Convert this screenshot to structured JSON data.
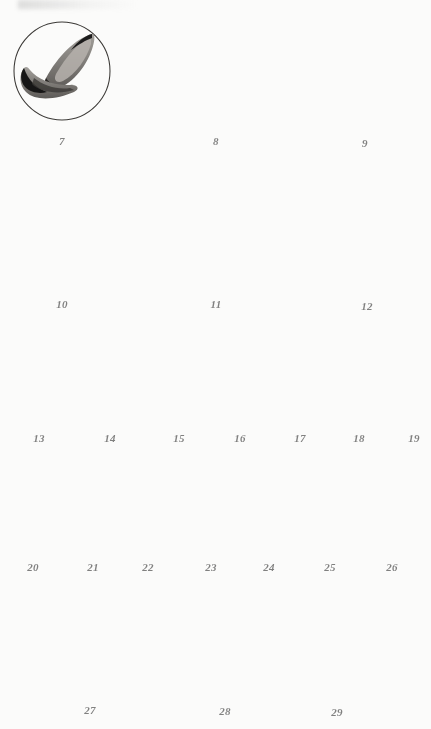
{
  "plate": {
    "title": "Microscopy plate of stained protozoan / flagellate specimens",
    "background_color": "#fbfbfa",
    "ink_color": "#1c1c1c",
    "figure_count": 23,
    "number_style": "italic serif",
    "rows": [
      {
        "row_id": "row-1",
        "kind": "circular-field",
        "labels": [
          "7",
          "8",
          "9"
        ]
      },
      {
        "row_id": "row-2",
        "kind": "circular-field",
        "labels": [
          "10",
          "11",
          "12"
        ]
      },
      {
        "row_id": "row-3",
        "kind": "isolated-specimen",
        "labels": [
          "13",
          "14",
          "15",
          "16",
          "17",
          "18",
          "19"
        ]
      },
      {
        "row_id": "row-4",
        "kind": "isolated-specimen",
        "labels": [
          "20",
          "21",
          "22",
          "23",
          "24",
          "25",
          "26"
        ]
      },
      {
        "row_id": "row-5",
        "kind": "photomicrograph",
        "labels": [
          "27",
          "28",
          "29"
        ]
      }
    ],
    "figures": [
      {
        "label": "7",
        "row": 1,
        "cx": 62,
        "cy": 71,
        "rx": 48,
        "ry": 49,
        "num_x": 62,
        "num_y": 135,
        "desc": "two elongate pointed bodies in circular field"
      },
      {
        "label": "8",
        "row": 1,
        "cx": 216,
        "cy": 71,
        "rx": 47,
        "ry": 50,
        "num_x": 216,
        "num_y": 135,
        "desc": "three-lobed rosette with dark centre"
      },
      {
        "label": "9",
        "row": 1,
        "cx": 365,
        "cy": 71,
        "rx": 45,
        "ry": 48,
        "num_x": 365,
        "num_y": 137,
        "desc": "two dark crescent bodies stacked"
      },
      {
        "label": "10",
        "row": 2,
        "cx": 62,
        "cy": 238,
        "rx": 45,
        "ry": 46,
        "num_x": 62,
        "num_y": 298,
        "desc": "near-empty field with single small dark blob"
      },
      {
        "label": "11",
        "row": 2,
        "cx": 216,
        "cy": 236,
        "rx": 45,
        "ry": 46,
        "num_x": 216,
        "num_y": 298,
        "desc": "single small heart-shaped dark body at centre"
      },
      {
        "label": "12",
        "row": 2,
        "cx": 367,
        "cy": 232,
        "rx": 51,
        "ry": 52,
        "num_x": 367,
        "num_y": 300,
        "desc": "two pear-shaped bodies with ringed nuclei"
      },
      {
        "label": "13",
        "row": 3,
        "cx": 39,
        "cy": 392,
        "num_x": 39,
        "num_y": 432,
        "desc": "round grey cyst with dark hook inside"
      },
      {
        "label": "14",
        "row": 3,
        "cx": 107,
        "cy": 394,
        "num_x": 110,
        "num_y": 432,
        "desc": "tear-drop body beside rounded body, both nucleated"
      },
      {
        "label": "15",
        "row": 3,
        "cx": 178,
        "cy": 392,
        "num_x": 179,
        "num_y": 432,
        "desc": "two small paired nucleated bodies"
      },
      {
        "label": "16",
        "row": 3,
        "cx": 239,
        "cy": 396,
        "num_x": 240,
        "num_y": 432,
        "desc": "single comma-shaped nucleated body"
      },
      {
        "label": "17",
        "row": 3,
        "cx": 299,
        "cy": 392,
        "num_x": 300,
        "num_y": 432,
        "desc": "small round body above dark flame-shaped body"
      },
      {
        "label": "18",
        "row": 3,
        "cx": 359,
        "cy": 393,
        "num_x": 359,
        "num_y": 432,
        "desc": "two pale round bodies, lower one with dark granule"
      },
      {
        "label": "19",
        "row": 3,
        "cx": 414,
        "cy": 394,
        "num_x": 414,
        "num_y": 432,
        "desc": "slender spindle body with central nucleus"
      },
      {
        "label": "20",
        "row": 4,
        "cx": 33,
        "cy": 518,
        "num_x": 33,
        "num_y": 561,
        "desc": "narrow spindle with dark nucleus"
      },
      {
        "label": "21",
        "row": 4,
        "cx": 93,
        "cy": 518,
        "num_x": 93,
        "num_y": 561,
        "desc": "crescent body with large dark nucleus"
      },
      {
        "label": "22",
        "row": 4,
        "cx": 148,
        "cy": 516,
        "num_x": 148,
        "num_y": 561,
        "desc": "slender sinuous body with nucleus and vacuole"
      },
      {
        "label": "23",
        "row": 4,
        "cx": 210,
        "cy": 516,
        "num_x": 211,
        "num_y": 561,
        "desc": "bent V-shaped body with dark anterior end"
      },
      {
        "label": "24",
        "row": 4,
        "cx": 268,
        "cy": 518,
        "num_x": 269,
        "num_y": 561,
        "desc": "spindle body with prominent ringed nucleus"
      },
      {
        "label": "25",
        "row": 4,
        "cx": 330,
        "cy": 518,
        "num_x": 330,
        "num_y": 561,
        "desc": "broad leaf-shaped body with dark nucleus"
      },
      {
        "label": "26",
        "row": 4,
        "cx": 392,
        "cy": 518,
        "num_x": 392,
        "num_y": 561,
        "desc": "hook-shaped body with dark nucleus"
      },
      {
        "label": "27",
        "row": 5,
        "cx": 95,
        "cy": 657,
        "num_x": 90,
        "num_y": 704,
        "desc": "photomicrograph of paired tadpole-form bodies with ringed nuclei"
      },
      {
        "label": "28",
        "row": 5,
        "cx": 226,
        "cy": 656,
        "num_x": 225,
        "num_y": 705,
        "desc": "photomicrograph of two bodies joined end to end, vertical"
      },
      {
        "label": "29",
        "row": 5,
        "cx": 335,
        "cy": 650,
        "num_x": 337,
        "num_y": 706,
        "desc": "photomicrograph of two bodies conjoined at dark anterior ends, V arrangement"
      }
    ]
  }
}
